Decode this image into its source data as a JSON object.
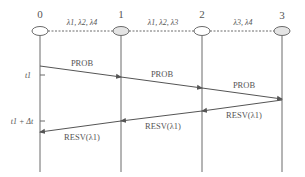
{
  "diagram": {
    "type": "sequence-diagram",
    "colors": {
      "line": "#6b6b6b",
      "text": "#555555",
      "node_fill": "#e4e4e4",
      "background": "#ffffff"
    },
    "nodes": [
      {
        "id": "0",
        "label": "0"
      },
      {
        "id": "1",
        "label": "1"
      },
      {
        "id": "2",
        "label": "2"
      },
      {
        "id": "3",
        "label": "3"
      }
    ],
    "links": [
      {
        "from": "0",
        "to": "1",
        "wavelengths": "λ1, λ2, λ4",
        "style": "dotted"
      },
      {
        "from": "1",
        "to": "2",
        "wavelengths": "λ1, λ2, λ3",
        "style": "dotted"
      },
      {
        "from": "2",
        "to": "3",
        "wavelengths": "λ3, λ4",
        "style": "dotted"
      }
    ],
    "time_marks": [
      {
        "label": "t1"
      },
      {
        "label": "t1 + Δt"
      }
    ],
    "messages": [
      {
        "from": "0",
        "to": "1",
        "label": "PROB"
      },
      {
        "from": "1",
        "to": "2",
        "label": "PROB"
      },
      {
        "from": "2",
        "to": "3",
        "label": "PROB"
      },
      {
        "from": "3",
        "to": "2",
        "label": "RESV(λ1)"
      },
      {
        "from": "2",
        "to": "1",
        "label": "RESV(λ1)"
      },
      {
        "from": "1",
        "to": "0",
        "label": "RESV(λ1)"
      }
    ]
  }
}
